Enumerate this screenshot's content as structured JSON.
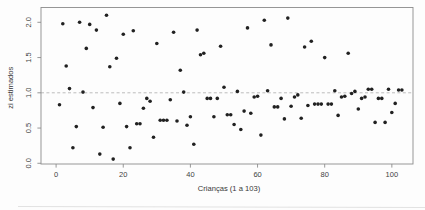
{
  "figure": {
    "xlabel": "Crianças (1 a 103)",
    "ylabel": "zi estimados"
  },
  "chart_data": {
    "type": "scatter",
    "title": "",
    "xlabel": "Crianças (1 a 103)",
    "ylabel": "zi estimados",
    "xlim": [
      -4.5,
      106.3
    ],
    "ylim": [
      -0.01,
      2.21
    ],
    "xticks": [
      0,
      20,
      40,
      60,
      80,
      100
    ],
    "xtick_labels": [
      "0",
      "20",
      "40",
      "60",
      "80",
      "100"
    ],
    "yticks": [
      0.0,
      0.5,
      1.0,
      1.5,
      2.0
    ],
    "ytick_labels": [
      "0.0",
      "0.5",
      "1.0",
      "1.5",
      "2.0"
    ],
    "grid": false,
    "legend": null,
    "point_color": "#212121",
    "box_color": "#8c8c8c",
    "reference_line": {
      "y": 1.0,
      "style": "dashed",
      "color": "#b5b5b5"
    },
    "x": [
      1,
      2,
      3,
      4,
      5,
      6,
      7,
      8,
      9,
      10,
      11,
      12,
      13,
      14,
      15,
      16,
      17,
      18,
      19,
      20,
      21,
      22,
      23,
      24,
      25,
      26,
      27,
      28,
      29,
      30,
      31,
      32,
      33,
      34,
      35,
      36,
      37,
      38,
      39,
      40,
      41,
      42,
      43,
      44,
      45,
      46,
      47,
      48,
      49,
      50,
      51,
      52,
      53,
      54,
      55,
      56,
      57,
      58,
      59,
      60,
      61,
      62,
      63,
      64,
      65,
      66,
      67,
      68,
      69,
      70,
      71,
      72,
      73,
      74,
      75,
      76,
      77,
      78,
      79,
      80,
      81,
      82,
      83,
      84,
      85,
      86,
      87,
      88,
      89,
      90,
      91,
      92,
      93,
      94,
      95,
      96,
      97,
      98,
      99,
      100,
      101,
      102,
      103
    ],
    "y": [
      0.83,
      1.98,
      1.38,
      1.06,
      0.22,
      0.52,
      2.0,
      1.01,
      1.63,
      1.97,
      0.79,
      1.89,
      0.13,
      0.51,
      2.1,
      1.37,
      0.06,
      1.49,
      0.85,
      1.83,
      0.52,
      0.22,
      1.88,
      0.56,
      0.56,
      0.78,
      0.92,
      0.88,
      0.37,
      1.7,
      0.61,
      0.61,
      0.61,
      0.9,
      1.86,
      0.6,
      1.32,
      1.01,
      0.54,
      0.66,
      0.27,
      1.89,
      1.54,
      1.56,
      0.92,
      0.92,
      0.66,
      0.92,
      1.66,
      1.08,
      0.69,
      0.69,
      0.55,
      1.02,
      0.48,
      0.74,
      1.92,
      0.71,
      0.94,
      0.95,
      0.4,
      2.03,
      1.03,
      1.68,
      0.8,
      0.8,
      0.92,
      0.63,
      2.06,
      0.81,
      0.94,
      0.97,
      0.64,
      1.65,
      0.82,
      1.73,
      0.84,
      0.84,
      0.84,
      1.5,
      0.84,
      0.84,
      1.03,
      0.68,
      0.94,
      0.95,
      1.56,
      0.99,
      1.02,
      0.77,
      0.92,
      0.94,
      1.05,
      1.05,
      0.58,
      0.92,
      0.92,
      0.58,
      1.05,
      0.72,
      0.85,
      1.04,
      1.04
    ]
  }
}
